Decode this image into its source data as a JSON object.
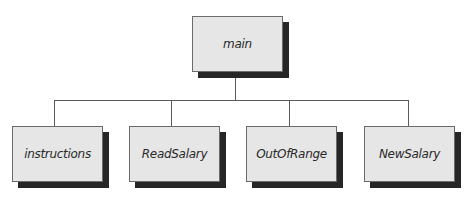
{
  "diagram": {
    "type": "hierarchy-chart",
    "root": {
      "label": "main"
    },
    "children": [
      {
        "label": "instructions"
      },
      {
        "label": "ReadSalary"
      },
      {
        "label": "OutOfRange"
      },
      {
        "label": "NewSalary"
      }
    ]
  }
}
